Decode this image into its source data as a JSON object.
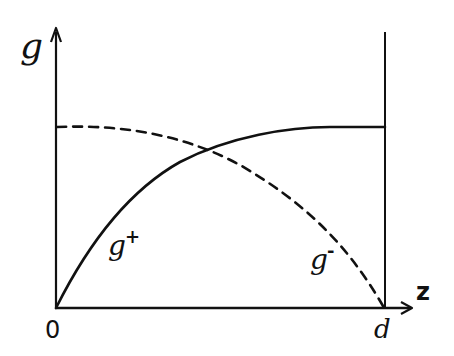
{
  "diagram": {
    "type": "hand-drawn profile plot",
    "y_axis_label": "g",
    "x_axis_label": "z",
    "origin_label": "0",
    "right_boundary_label": "d",
    "curves": [
      {
        "name": "g+",
        "base": "g",
        "sup": "+",
        "style": "solid",
        "description": "rises from 0 at z=0, saturating to a constant plateau reaching z=d"
      },
      {
        "name": "g-",
        "base": "g",
        "sup": "-",
        "style": "dashed",
        "description": "starts at plateau value at z=0, nearly flat then falls to 0 at z=d"
      }
    ],
    "stroke_color": "#111111",
    "background_color": "#ffffff"
  }
}
